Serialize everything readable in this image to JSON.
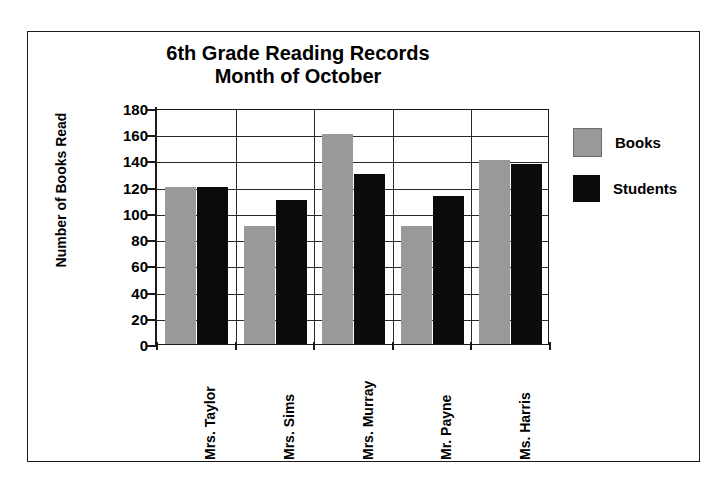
{
  "chart_data": {
    "type": "bar",
    "title": "6th Grade Reading Records Month of October",
    "title_lines": [
      "6th Grade Reading Records",
      "Month of October"
    ],
    "xlabel": "",
    "ylabel": "Number of Books Read",
    "ylim": [
      0,
      180
    ],
    "ytick_step": 20,
    "yticks": [
      180,
      160,
      140,
      120,
      100,
      80,
      60,
      40,
      20,
      0
    ],
    "ytick_labels": [
      "180",
      "160",
      "140",
      "120",
      "100",
      "80",
      "60",
      "40",
      "20",
      "0"
    ],
    "grid": true,
    "legend_position": "right",
    "categories": [
      "Mrs. Taylor",
      "Mrs. Sims",
      "Mrs. Murray",
      "Mr. Payne",
      "Ms. Harris"
    ],
    "series": [
      {
        "name": "Books",
        "color": "#999999",
        "values": [
          120,
          90,
          160,
          90,
          140
        ]
      },
      {
        "name": "Students",
        "color": "#0b0b0b",
        "values": [
          120,
          110,
          130,
          113,
          137
        ]
      }
    ]
  },
  "legend": {
    "items": [
      {
        "label": "Books"
      },
      {
        "label": "Students"
      }
    ]
  }
}
